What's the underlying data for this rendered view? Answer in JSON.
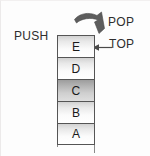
{
  "diagram": {
    "background_color": "#fdfdfd",
    "labels": {
      "push": "PUSH",
      "pop": "POP",
      "top": "TOP"
    },
    "icons": {
      "pop_arrow": "curved-swoosh-arrow-down-right",
      "top_arrow": "arrow-left-pointer"
    },
    "colors": {
      "cell_border": "#555555",
      "cell_fill_light": "#ffffff",
      "cell_fill_shaded": "#b4b4b4",
      "arrow": "#5a5a5a",
      "text": "#2e2e2e"
    },
    "stack": {
      "orientation": "vertical-top-is-first",
      "top_index": 0,
      "cells": [
        {
          "letter": "E",
          "shaded": false,
          "position": "top"
        },
        {
          "letter": "D",
          "shaded": false,
          "position": "2"
        },
        {
          "letter": "C",
          "shaded": true,
          "position": "3"
        },
        {
          "letter": "B",
          "shaded": false,
          "position": "4"
        },
        {
          "letter": "A",
          "shaded": false,
          "position": "bottom"
        }
      ]
    }
  }
}
